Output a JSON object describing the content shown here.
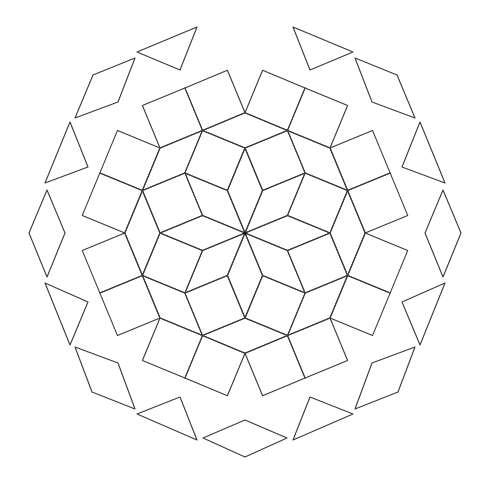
{
  "figure": {
    "description": "Octagonal Ammann-Beenker rhombus/square tiling patch with separated boundary pieces",
    "width": 483,
    "height": 482,
    "center": [
      245,
      233
    ],
    "edge_length": 46,
    "stroke_color": "#3a3a3a",
    "background_color": "#ffffff",
    "interior_radius": 190
  },
  "boundary_pieces": [
    {
      "name": "top-left-triangle",
      "shape": "triangle",
      "points": [
        [
          137,
          52
        ],
        [
          197,
          27
        ],
        [
          180,
          70
        ]
      ]
    },
    {
      "name": "top-right-triangle",
      "shape": "triangle",
      "points": [
        [
          353,
          52
        ],
        [
          293,
          27
        ],
        [
          310,
          70
        ]
      ]
    },
    {
      "name": "upper-left-rhombus",
      "shape": "rhombus",
      "points": [
        [
          135,
          58
        ],
        [
          118,
          102
        ],
        [
          75,
          118
        ],
        [
          93,
          75
        ]
      ]
    },
    {
      "name": "upper-right-rhombus",
      "shape": "rhombus",
      "points": [
        [
          355,
          58
        ],
        [
          372,
          102
        ],
        [
          415,
          118
        ],
        [
          397,
          75
        ]
      ]
    },
    {
      "name": "left-upper-triangle",
      "shape": "triangle",
      "points": [
        [
          70,
          122
        ],
        [
          88,
          167
        ],
        [
          45,
          183
        ]
      ]
    },
    {
      "name": "right-upper-triangle",
      "shape": "triangle",
      "points": [
        [
          420,
          122
        ],
        [
          402,
          167
        ],
        [
          445,
          183
        ]
      ]
    },
    {
      "name": "left-rhombus",
      "shape": "rhombus",
      "points": [
        [
          47,
          190
        ],
        [
          65,
          233
        ],
        [
          47,
          277
        ],
        [
          29,
          233
        ]
      ]
    },
    {
      "name": "right-rhombus",
      "shape": "rhombus",
      "points": [
        [
          443,
          190
        ],
        [
          425,
          233
        ],
        [
          443,
          277
        ],
        [
          461,
          233
        ]
      ]
    },
    {
      "name": "left-lower-triangle",
      "shape": "triangle",
      "points": [
        [
          45,
          283
        ],
        [
          88,
          302
        ],
        [
          70,
          345
        ]
      ]
    },
    {
      "name": "right-lower-triangle",
      "shape": "triangle",
      "points": [
        [
          445,
          283
        ],
        [
          402,
          302
        ],
        [
          420,
          345
        ]
      ]
    },
    {
      "name": "lower-left-rhombus",
      "shape": "rhombus",
      "points": [
        [
          75,
          347
        ],
        [
          118,
          363
        ],
        [
          135,
          409
        ],
        [
          92,
          392
        ]
      ]
    },
    {
      "name": "lower-right-rhombus",
      "shape": "rhombus",
      "points": [
        [
          415,
          347
        ],
        [
          372,
          363
        ],
        [
          355,
          409
        ],
        [
          398,
          392
        ]
      ]
    },
    {
      "name": "bottom-left-triangle",
      "shape": "triangle",
      "points": [
        [
          137,
          414
        ],
        [
          180,
          397
        ],
        [
          197,
          440
        ]
      ]
    },
    {
      "name": "bottom-right-triangle",
      "shape": "triangle",
      "points": [
        [
          353,
          414
        ],
        [
          310,
          397
        ],
        [
          293,
          440
        ]
      ]
    },
    {
      "name": "bottom-rhombus",
      "shape": "rhombus",
      "points": [
        [
          203,
          438
        ],
        [
          245,
          420
        ],
        [
          287,
          438
        ],
        [
          245,
          457
        ]
      ]
    }
  ]
}
